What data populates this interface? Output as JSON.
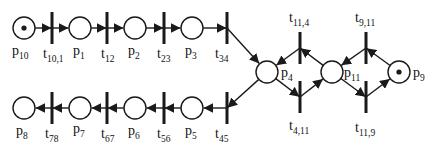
{
  "colors": {
    "stroke": "#1a1a1a",
    "background": "#ffffff"
  },
  "places": [
    {
      "id": "p10",
      "name": "p",
      "sub": "10",
      "x": 24,
      "y": 28,
      "token": true,
      "lx": 12,
      "ly": 55
    },
    {
      "id": "p1",
      "name": "p",
      "sub": "1",
      "x": 80,
      "y": 28,
      "token": false,
      "lx": 73,
      "ly": 55
    },
    {
      "id": "p2",
      "name": "p",
      "sub": "2",
      "x": 135,
      "y": 28,
      "token": false,
      "lx": 128,
      "ly": 55
    },
    {
      "id": "p3",
      "name": "p",
      "sub": "3",
      "x": 192,
      "y": 28,
      "token": false,
      "lx": 185,
      "ly": 55
    },
    {
      "id": "p4",
      "name": "p",
      "sub": "4",
      "x": 267,
      "y": 72,
      "token": false,
      "lx": 281,
      "ly": 77
    },
    {
      "id": "p11",
      "name": "p",
      "sub": "11",
      "x": 332,
      "y": 72,
      "token": false,
      "lx": 344,
      "ly": 77
    },
    {
      "id": "p9",
      "name": "p",
      "sub": "9",
      "x": 399,
      "y": 72,
      "token": true,
      "lx": 413,
      "ly": 77
    },
    {
      "id": "p5",
      "name": "p",
      "sub": "5",
      "x": 192,
      "y": 108,
      "token": false,
      "lx": 185,
      "ly": 135
    },
    {
      "id": "p6",
      "name": "p",
      "sub": "6",
      "x": 135,
      "y": 108,
      "token": false,
      "lx": 128,
      "ly": 135
    },
    {
      "id": "p7",
      "name": "p",
      "sub": "7",
      "x": 80,
      "y": 108,
      "token": false,
      "lx": 73,
      "ly": 133
    },
    {
      "id": "p8",
      "name": "p",
      "sub": "8",
      "x": 24,
      "y": 108,
      "token": false,
      "lx": 16,
      "ly": 135
    }
  ],
  "transitions": [
    {
      "id": "t10_1",
      "name": "t",
      "sub": "10,1",
      "x": 52,
      "y": 28,
      "lx": 43,
      "ly": 58
    },
    {
      "id": "t12",
      "name": "t",
      "sub": "12",
      "x": 107,
      "y": 28,
      "lx": 101,
      "ly": 58
    },
    {
      "id": "t23",
      "name": "t",
      "sub": "23",
      "x": 164,
      "y": 28,
      "lx": 157,
      "ly": 58
    },
    {
      "id": "t34",
      "name": "t",
      "sub": "34",
      "x": 227,
      "y": 28,
      "lx": 215,
      "ly": 58
    },
    {
      "id": "t11_4",
      "name": "t",
      "sub": "11,4",
      "x": 300,
      "y": 48,
      "lx": 289,
      "ly": 22
    },
    {
      "id": "t9_11",
      "name": "t",
      "sub": "9,11",
      "x": 366,
      "y": 48,
      "lx": 355,
      "ly": 22
    },
    {
      "id": "t4_11",
      "name": "t",
      "sub": "4,11",
      "x": 300,
      "y": 97,
      "lx": 289,
      "ly": 130
    },
    {
      "id": "t11_9",
      "name": "t",
      "sub": "11,9",
      "x": 366,
      "y": 97,
      "lx": 355,
      "ly": 132
    },
    {
      "id": "t45",
      "name": "t",
      "sub": "45",
      "x": 227,
      "y": 108,
      "lx": 215,
      "ly": 138
    },
    {
      "id": "t56",
      "name": "t",
      "sub": "56",
      "x": 164,
      "y": 108,
      "lx": 157,
      "ly": 138
    },
    {
      "id": "t67",
      "name": "t",
      "sub": "67",
      "x": 107,
      "y": 108,
      "lx": 101,
      "ly": 138
    },
    {
      "id": "t78",
      "name": "t",
      "sub": "78",
      "x": 52,
      "y": 108,
      "lx": 45,
      "ly": 138
    }
  ],
  "arcs": [
    {
      "from": "p10",
      "to": "t10_1"
    },
    {
      "from": "t10_1",
      "to": "p1"
    },
    {
      "from": "p1",
      "to": "t12"
    },
    {
      "from": "t12",
      "to": "p2"
    },
    {
      "from": "p2",
      "to": "t23"
    },
    {
      "from": "t23",
      "to": "p3"
    },
    {
      "from": "p3",
      "to": "t34"
    },
    {
      "from": "t34",
      "to": "p4"
    },
    {
      "from": "p11",
      "to": "t11_4"
    },
    {
      "from": "t11_4",
      "to": "p4"
    },
    {
      "from": "p9",
      "to": "t9_11"
    },
    {
      "from": "t9_11",
      "to": "p11"
    },
    {
      "from": "p4",
      "to": "t4_11"
    },
    {
      "from": "t4_11",
      "to": "p11"
    },
    {
      "from": "p11",
      "to": "t11_9"
    },
    {
      "from": "t11_9",
      "to": "p9"
    },
    {
      "from": "p4",
      "to": "t45"
    },
    {
      "from": "t45",
      "to": "p5"
    },
    {
      "from": "p5",
      "to": "t56"
    },
    {
      "from": "t56",
      "to": "p6"
    },
    {
      "from": "p6",
      "to": "t67"
    },
    {
      "from": "t67",
      "to": "p7"
    },
    {
      "from": "p7",
      "to": "t78"
    },
    {
      "from": "t78",
      "to": "p8"
    }
  ]
}
